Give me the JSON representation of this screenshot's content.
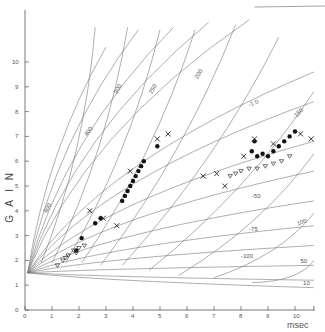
{
  "chart_data": {
    "type": "scatter",
    "title": "",
    "xlabel": "msec",
    "ylabel": "G A I N",
    "xlim": [
      0,
      10.5
    ],
    "ylim": [
      0,
      11
    ],
    "x_ticks": [
      "0",
      "1",
      "2",
      "3",
      "4",
      "5",
      "6",
      "7",
      "8",
      "9",
      "10"
    ],
    "y_ticks": [
      "0",
      "1",
      "2",
      "3",
      "4",
      "5",
      "6",
      "7",
      "8",
      "9",
      "10"
    ],
    "grid": false,
    "legend": null,
    "curve_labels": [
      "600",
      "400",
      "300",
      "250",
      "200",
      "-1.0",
      "-150",
      "-50",
      "-75",
      "-100",
      "100",
      "50",
      "10"
    ],
    "series": [
      {
        "name": "filled circles",
        "marker": "circle-filled",
        "points": [
          [
            1.9,
            2.4
          ],
          [
            2.1,
            2.9
          ],
          [
            2.6,
            3.5
          ],
          [
            2.8,
            3.7
          ],
          [
            3.6,
            4.4
          ],
          [
            3.7,
            4.6
          ],
          [
            3.8,
            4.8
          ],
          [
            3.9,
            5.0
          ],
          [
            4.0,
            5.2
          ],
          [
            4.1,
            5.4
          ],
          [
            4.2,
            5.6
          ],
          [
            4.3,
            5.8
          ],
          [
            4.4,
            6.0
          ],
          [
            4.9,
            6.6
          ],
          [
            8.4,
            6.4
          ],
          [
            8.6,
            6.2
          ],
          [
            8.8,
            6.3
          ],
          [
            9.0,
            6.2
          ],
          [
            9.2,
            6.4
          ],
          [
            9.4,
            6.6
          ],
          [
            9.8,
            7.0
          ],
          [
            10.0,
            7.2
          ],
          [
            8.5,
            6.8
          ],
          [
            9.6,
            6.8
          ]
        ]
      },
      {
        "name": "crosses",
        "marker": "x",
        "points": [
          [
            2.4,
            4.0
          ],
          [
            2.9,
            3.7
          ],
          [
            3.4,
            3.4
          ],
          [
            3.9,
            5.6
          ],
          [
            4.9,
            6.9
          ],
          [
            5.3,
            7.1
          ],
          [
            6.6,
            5.4
          ],
          [
            7.1,
            5.5
          ],
          [
            7.4,
            5.0
          ],
          [
            8.1,
            6.2
          ],
          [
            8.5,
            6.9
          ],
          [
            9.2,
            6.7
          ],
          [
            10.2,
            7.1
          ],
          [
            10.6,
            6.9
          ]
        ]
      },
      {
        "name": "open triangles",
        "marker": "triangle-open",
        "points": [
          [
            1.2,
            1.8
          ],
          [
            1.4,
            2.0
          ],
          [
            1.6,
            2.2
          ],
          [
            1.8,
            2.4
          ],
          [
            2.0,
            2.5
          ],
          [
            2.2,
            2.6
          ],
          [
            1.5,
            2.1
          ],
          [
            1.9,
            2.3
          ],
          [
            7.6,
            5.4
          ],
          [
            7.8,
            5.5
          ],
          [
            8.0,
            5.6
          ],
          [
            8.3,
            5.7
          ],
          [
            8.6,
            5.7
          ],
          [
            8.9,
            5.8
          ],
          [
            9.2,
            5.9
          ],
          [
            9.5,
            6.0
          ],
          [
            9.8,
            6.2
          ]
        ]
      }
    ]
  }
}
